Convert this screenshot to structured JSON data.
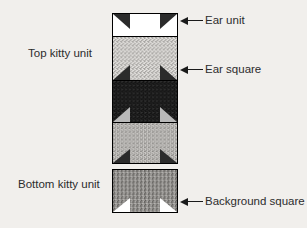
{
  "page": {
    "background_color": "#f1efec",
    "cropped_top_text": ""
  },
  "diagram": {
    "top_unit": {
      "label": "Top kitty unit",
      "squares": [
        {
          "name": "ear-unit",
          "fill": "white",
          "fill_color": "#ffffff",
          "corner_triangles": "top-left, top-right",
          "triangle_color": "#2b2b2b"
        },
        {
          "name": "ear-square",
          "fill": "light-speckle",
          "fill_color": "#d6d4d2",
          "corner_triangles": "bottom-left, bottom-right",
          "triangle_color": "#2b2b2b"
        },
        {
          "name": "dark-square",
          "fill": "dark-speckle",
          "fill_color": "#1d1d1d",
          "corner_triangles": "bottom-left, bottom-right",
          "triangle_color": "#b9b9b9"
        },
        {
          "name": "body-square",
          "fill": "medium-light-speckle",
          "fill_color": "#c4c2bf",
          "corner_triangles": "bottom-left, bottom-right",
          "triangle_color": "#2b2b2b"
        }
      ]
    },
    "bottom_unit": {
      "label": "Bottom kitty unit",
      "squares": [
        {
          "name": "background-square",
          "fill": "medium-speckle",
          "fill_color": "#8e8c89",
          "corner_triangles": "bottom-left, bottom-right",
          "triangle_color": "#ffffff"
        }
      ]
    },
    "callouts": [
      {
        "id": "ear-unit-callout",
        "label": "Ear unit"
      },
      {
        "id": "ear-square-callout",
        "label": "Ear square"
      },
      {
        "id": "background-square-callout",
        "label": "Background square"
      }
    ]
  }
}
